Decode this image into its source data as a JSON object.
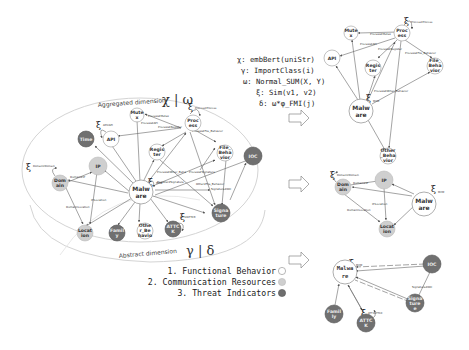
{
  "formulas": [
    {
      "symbol": "χ",
      "text": ": embBert(uniStr)"
    },
    {
      "symbol": "γ",
      "text": ": ImportClass(i)"
    },
    {
      "symbol": "ω",
      "text": ": Normal_SUM(X, Y)"
    },
    {
      "symbol": "ξ",
      "text": ": Sim(v1,  v2)"
    },
    {
      "symbol": "δ",
      "text": ": ω*φ_FMI(j)"
    }
  ],
  "main_graph": {
    "aggregated_label": "Aggregated dimension",
    "aggregated_symbol": "χ | ω",
    "abstract_label": "Abstract dimension",
    "abstract_symbol": "γ | δ",
    "nodes": [
      {
        "id": "malware",
        "label1": "Malw",
        "label2": "are",
        "type": "functional"
      },
      {
        "id": "mutex",
        "label1": "Mute",
        "label2": "x",
        "type": "functional"
      },
      {
        "id": "process",
        "label1": "Proc",
        "label2": "ess",
        "type": "functional"
      },
      {
        "id": "api",
        "label1": "API",
        "label2": "",
        "type": "functional"
      },
      {
        "id": "register",
        "label1": "Regis",
        "label2": "ter",
        "type": "functional"
      },
      {
        "id": "file_behavior",
        "label1": "File_",
        "label2": "Beha",
        "label3": "vior",
        "type": "functional"
      },
      {
        "id": "time",
        "label1": "Time",
        "label2": "",
        "type": "threat"
      },
      {
        "id": "ip",
        "label1": "IP",
        "label2": "",
        "type": "communication"
      },
      {
        "id": "domain",
        "label1": "Dom",
        "label2": "ain",
        "type": "communication"
      },
      {
        "id": "location",
        "label1": "Locat",
        "label2": "ion",
        "type": "communication"
      },
      {
        "id": "family",
        "label1": "Famil",
        "label2": "y",
        "type": "threat"
      },
      {
        "id": "other_behavior",
        "label1": "Othe",
        "label2": "r_Be",
        "label3": "havio",
        "type": "functional"
      },
      {
        "id": "attck",
        "label1": "ATTC",
        "label2": "K",
        "type": "threat"
      },
      {
        "id": "signature",
        "label1": "Signa",
        "label2": "ture",
        "type": "threat"
      },
      {
        "id": "ioc",
        "label1": "IOC",
        "label2": "",
        "type": "threat"
      }
    ],
    "edge_labels": [
      "Process2Mutex",
      "Process2API",
      "Process2Register",
      "Process2File_Behavior",
      "Process2Other_Beha",
      "Process2Signature",
      "Register2Signature",
      "Other2File_Behavior",
      "Signature2IOC",
      "Domain2IP",
      "IPILocation",
      "DomainILocation",
      "ATT2ATTCK"
    ],
    "similarity_labels": [
      {
        "id": "process",
        "sub": "Process2Process"
      },
      {
        "id": "api",
        "sub": "API2API"
      },
      {
        "id": "domain",
        "sub": "Domain2Domain"
      },
      {
        "id": "malware",
        "sub": "M2M"
      },
      {
        "id": "attck",
        "sub": "ATT2ATTCK"
      }
    ]
  },
  "sub_graphs": [
    {
      "name": "functional-behavior-subgraph",
      "nodes": [
        "Malw/are",
        "Mute/x",
        "Proc/ess",
        "API",
        "Regis/ter",
        "File_/Beha/vior",
        "Other/_Beha/vior"
      ],
      "edge_labels": [
        "Process2Mutex",
        "Process2API",
        "Process2Register",
        "Process2File_Behavior",
        "Process2Other_Behavior"
      ],
      "zeta_labels": [
        "Process2Process",
        "M2M"
      ]
    },
    {
      "name": "communication-resources-subgraph",
      "nodes": [
        "Dom/ain",
        "IP",
        "Locat/ion",
        "Malw/are"
      ],
      "edge_labels": [
        "Domain2IP",
        "IPILocation",
        "DomainILocation"
      ],
      "zeta_labels": [
        "Domain2Domain",
        "M2M"
      ]
    },
    {
      "name": "threat-indicators-subgraph",
      "nodes": [
        "Malwa/re",
        "IOC",
        "Signa/ture",
        "Famil/y",
        "ATTC/K"
      ],
      "edge_labels": [
        "Signature2IOC"
      ],
      "zeta_labels": [
        "M2M",
        "ATT2ATTCK"
      ]
    }
  ],
  "legend": [
    {
      "label": "1. Functional Behavior",
      "color": "#ffffff",
      "stroke": "#888888"
    },
    {
      "label": "2. Communication Resources",
      "color": "#cfcfcf",
      "stroke": "#bbbbbb"
    },
    {
      "label": "3. Threat Indicators",
      "color": "#6e6e6e",
      "stroke": "#555555"
    }
  ],
  "colors": {
    "functional": "#ffffff",
    "communication": "#cfcfcf",
    "threat": "#707070",
    "edge": "#666666",
    "ellipse": "#cccccc"
  }
}
